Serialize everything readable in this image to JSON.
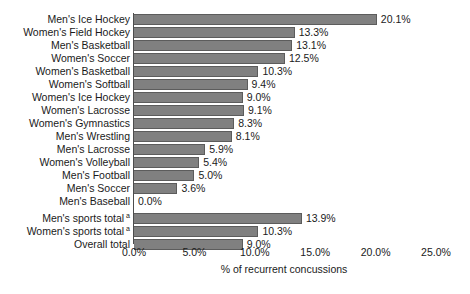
{
  "chart_data": {
    "type": "bar",
    "orientation": "horizontal",
    "title": "",
    "xlabel": "% of recurrent concussions",
    "ylabel": "",
    "xlim": [
      0,
      25
    ],
    "xticks": [
      "0.0%",
      "5.0%",
      "10.0%",
      "15.0%",
      "20.0%",
      "25.0%"
    ],
    "xtick_values": [
      0,
      5,
      10,
      15,
      20,
      25
    ],
    "grid": false,
    "legend": null,
    "bar_color": "#808080",
    "bar_edge_color": "#5c5c5c",
    "categories": [
      "Men's Ice Hockey",
      "Women's Field Hockey",
      "Men's Basketball",
      "Women's Soccer",
      "Women's Basketball",
      "Women's Softball",
      "Women's Ice Hockey",
      "Women's Lacrosse",
      "Women's Gymnastics",
      "Men's Wrestling",
      "Men's Lacrosse",
      "Women's Volleyball",
      "Men's Football",
      "Men's Soccer",
      "Men's Baseball",
      "Men's sports total",
      "Women's sports total",
      "Overall total"
    ],
    "values": [
      20.1,
      13.3,
      13.1,
      12.5,
      10.3,
      9.4,
      9.0,
      9.1,
      8.3,
      8.1,
      5.9,
      5.4,
      5.0,
      3.6,
      0.0,
      13.9,
      10.3,
      9.0
    ],
    "value_labels": [
      "20.1%",
      "13.3%",
      "13.1%",
      "12.5%",
      "10.3%",
      "9.4%",
      "9.0%",
      "9.1%",
      "8.3%",
      "8.1%",
      "5.9%",
      "5.4%",
      "5.0%",
      "3.6%",
      "0.0%",
      "13.9%",
      "10.3%",
      "9.0%"
    ],
    "footnote_markers": [
      "",
      "",
      "",
      "",
      "",
      "",
      "",
      "",
      "",
      "",
      "",
      "",
      "",
      "",
      "",
      "a",
      "a",
      ""
    ],
    "group_break_after_index": 14
  },
  "rows": [
    {
      "label": "Men's Ice Hockey",
      "value": 20.1,
      "value_label": "20.1%",
      "marker": ""
    },
    {
      "label": "Women's Field Hockey",
      "value": 13.3,
      "value_label": "13.3%",
      "marker": ""
    },
    {
      "label": "Men's Basketball",
      "value": 13.1,
      "value_label": "13.1%",
      "marker": ""
    },
    {
      "label": "Women's Soccer",
      "value": 12.5,
      "value_label": "12.5%",
      "marker": ""
    },
    {
      "label": "Women's Basketball",
      "value": 10.3,
      "value_label": "10.3%",
      "marker": ""
    },
    {
      "label": "Women's Softball",
      "value": 9.4,
      "value_label": "9.4%",
      "marker": ""
    },
    {
      "label": "Women's Ice Hockey",
      "value": 9.0,
      "value_label": "9.0%",
      "marker": ""
    },
    {
      "label": "Women's Lacrosse",
      "value": 9.1,
      "value_label": "9.1%",
      "marker": ""
    },
    {
      "label": "Women's Gymnastics",
      "value": 8.3,
      "value_label": "8.3%",
      "marker": ""
    },
    {
      "label": "Men's Wrestling",
      "value": 8.1,
      "value_label": "8.1%",
      "marker": ""
    },
    {
      "label": "Men's Lacrosse",
      "value": 5.9,
      "value_label": "5.9%",
      "marker": ""
    },
    {
      "label": "Women's Volleyball",
      "value": 5.4,
      "value_label": "5.4%",
      "marker": ""
    },
    {
      "label": "Men's Football",
      "value": 5.0,
      "value_label": "5.0%",
      "marker": ""
    },
    {
      "label": "Men's Soccer",
      "value": 3.6,
      "value_label": "3.6%",
      "marker": ""
    },
    {
      "label": "Men's Baseball",
      "value": 0.0,
      "value_label": "0.0%",
      "marker": ""
    },
    {
      "label": "Men's sports total",
      "value": 13.9,
      "value_label": "13.9%",
      "marker": "a"
    },
    {
      "label": "Women's sports total",
      "value": 10.3,
      "value_label": "10.3%",
      "marker": "a"
    },
    {
      "label": "Overall total",
      "value": 9.0,
      "value_label": "9.0%",
      "marker": ""
    }
  ],
  "xaxis": {
    "title": "% of recurrent concussions",
    "ticks": [
      "0.0%",
      "5.0%",
      "10.0%",
      "15.0%",
      "20.0%",
      "25.0%"
    ]
  }
}
